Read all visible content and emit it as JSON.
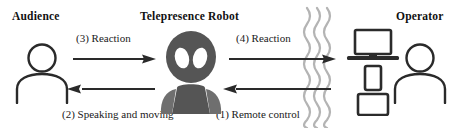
{
  "diagram": {
    "headings": [
      {
        "id": "audience",
        "label": "Audience"
      },
      {
        "id": "robot",
        "label": "Telepresence Robot"
      },
      {
        "id": "operator",
        "label": "Operator"
      }
    ],
    "arrows": [
      {
        "id": "3",
        "label": "(3) Reaction",
        "direction": "right",
        "from": "audience",
        "to": "robot"
      },
      {
        "id": "4",
        "label": "(4) Reaction",
        "direction": "right",
        "from": "robot",
        "to": "operator"
      },
      {
        "id": "2",
        "label": "(2) Speaking and moving",
        "direction": "left",
        "from": "robot",
        "to": "audience"
      },
      {
        "id": "1",
        "label": "(1) Remote control",
        "direction": "left",
        "from": "operator",
        "to": "robot"
      }
    ],
    "icons": {
      "audience": "person-outline-icon",
      "operator": "person-outline-icon",
      "robot": "telepresence-robot-icon",
      "laptop": "laptop-icon",
      "phone": "smartphone-icon",
      "tablet": "tablet-icon",
      "wireless": "wireless-wavy-lines-icon"
    },
    "colors": {
      "ink": "#1a1a1a",
      "robot_body": "#555555",
      "robot_arms": "#6f6f6f",
      "robot_eye": "#ffffff",
      "wave": "#b4b4b4",
      "device": "#2b2b2b"
    }
  }
}
